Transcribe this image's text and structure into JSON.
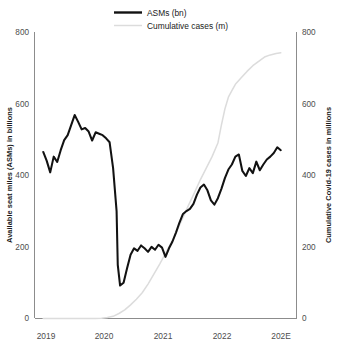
{
  "chart_data": {
    "type": "line",
    "title": "",
    "subtitle": "",
    "xlabel": "",
    "ylabel": "Available seat miles (ASMs) in billions",
    "y2label": "Cumulative Covid-19 cases in millions",
    "grid": false,
    "legend_position": "top-center",
    "ylim": [
      0,
      800
    ],
    "y2lim": [
      0,
      800
    ],
    "yticks": [
      "0",
      "200",
      "400",
      "600",
      "800"
    ],
    "ytick_values": [
      0,
      200,
      400,
      600,
      800
    ],
    "y2ticks": [
      "0",
      "200",
      "400",
      "600",
      "800"
    ],
    "y2tick_values": [
      0,
      200,
      400,
      600,
      800
    ],
    "xticks": [
      "2019",
      "2020",
      "2021",
      "2022",
      "202E"
    ],
    "xtick_values": [
      2019,
      2020,
      2021,
      2022,
      2023
    ],
    "xlim": [
      2018.85,
      2023.35
    ],
    "legend": [
      {
        "name": "ASMs (bn)",
        "color": "#121212",
        "width": "thick"
      },
      {
        "name": "Cumulative cases (m)",
        "color": "#dcdcdc",
        "width": "thin"
      }
    ],
    "series": [
      {
        "name": "ASMs (bn)",
        "axis": "left",
        "unit": "billions",
        "color": "#121212",
        "x": [
          2019.0,
          2019.06,
          2019.12,
          2019.18,
          2019.24,
          2019.3,
          2019.36,
          2019.42,
          2019.48,
          2019.54,
          2019.6,
          2019.66,
          2019.72,
          2019.78,
          2019.84,
          2019.9,
          2019.96,
          2020.02,
          2020.08,
          2020.14,
          2020.2,
          2020.26,
          2020.28,
          2020.32,
          2020.38,
          2020.44,
          2020.5,
          2020.56,
          2020.62,
          2020.68,
          2020.74,
          2020.8,
          2020.86,
          2020.92,
          2020.98,
          2021.04,
          2021.1,
          2021.16,
          2021.22,
          2021.28,
          2021.34,
          2021.4,
          2021.46,
          2021.52,
          2021.58,
          2021.64,
          2021.7,
          2021.76,
          2021.82,
          2021.88,
          2021.94,
          2022.0,
          2022.06,
          2022.12,
          2022.18,
          2022.24,
          2022.3,
          2022.36,
          2022.42,
          2022.48,
          2022.54,
          2022.6,
          2022.66,
          2022.72,
          2022.78,
          2022.84,
          2022.9,
          2022.96,
          2023.02,
          2023.08
        ],
        "values": [
          465,
          440,
          408,
          452,
          437,
          470,
          498,
          512,
          540,
          568,
          549,
          528,
          532,
          522,
          497,
          520,
          516,
          512,
          503,
          492,
          420,
          300,
          150,
          92,
          100,
          140,
          178,
          196,
          189,
          204,
          196,
          186,
          200,
          192,
          206,
          198,
          172,
          196,
          215,
          240,
          268,
          292,
          300,
          306,
          320,
          346,
          366,
          374,
          358,
          330,
          318,
          336,
          362,
          392,
          416,
          430,
          452,
          458,
          412,
          398,
          420,
          406,
          438,
          414,
          430,
          444,
          452,
          462,
          478,
          470
        ]
      },
      {
        "name": "Cumulative cases (m)",
        "axis": "right",
        "unit": "millions",
        "color": "#dcdcdc",
        "x": [
          2019.0,
          2019.5,
          2019.9,
          2020.0,
          2020.1,
          2020.2,
          2020.3,
          2020.4,
          2020.5,
          2020.6,
          2020.7,
          2020.8,
          2020.9,
          2021.0,
          2021.1,
          2021.2,
          2021.3,
          2021.4,
          2021.5,
          2021.6,
          2021.7,
          2021.8,
          2021.9,
          2022.0,
          2022.06,
          2022.12,
          2022.18,
          2022.24,
          2022.3,
          2022.4,
          2022.5,
          2022.6,
          2022.7,
          2022.8,
          2022.9,
          2023.0,
          2023.08
        ],
        "values": [
          0,
          0,
          0,
          1,
          3,
          6,
          14,
          24,
          38,
          54,
          72,
          96,
          124,
          152,
          182,
          212,
          246,
          282,
          318,
          352,
          388,
          420,
          452,
          490,
          540,
          585,
          618,
          636,
          654,
          672,
          690,
          706,
          718,
          730,
          736,
          740,
          742
        ]
      }
    ],
    "annotations": [
      {
        "text": "COVID-19 collapse trough",
        "series": "ASMs (bn)",
        "x": 2020.32,
        "value": 92
      },
      {
        "text": "Pre-pandemic peak",
        "series": "ASMs (bn)",
        "x": 2019.54,
        "value": 568
      }
    ]
  }
}
